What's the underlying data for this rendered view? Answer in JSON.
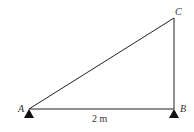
{
  "diagram": {
    "type": "truss-triangle",
    "nodes": [
      {
        "id": "A",
        "label": "A",
        "x": 29,
        "y": 109,
        "support": "pin"
      },
      {
        "id": "B",
        "label": "B",
        "x": 174,
        "y": 109,
        "support": "pin"
      },
      {
        "id": "C",
        "label": "C",
        "x": 174,
        "y": 18,
        "support": null
      }
    ],
    "members": [
      {
        "from": "A",
        "to": "B"
      },
      {
        "from": "B",
        "to": "C"
      },
      {
        "from": "A",
        "to": "C"
      }
    ],
    "dimension": {
      "label": "2 m",
      "between": [
        "A",
        "B"
      ]
    },
    "colors": {
      "line": "#222222",
      "text": "#333333",
      "background": "#ffffff"
    }
  }
}
